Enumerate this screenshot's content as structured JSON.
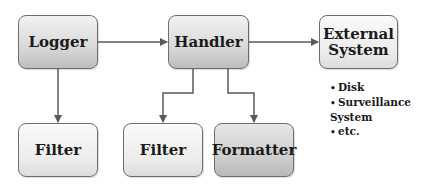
{
  "diagram": {
    "nodes": [
      {
        "id": "logger",
        "label": "Logger"
      },
      {
        "id": "handler",
        "label": "Handler"
      },
      {
        "id": "external",
        "label_line1": "External",
        "label_line2": "System"
      },
      {
        "id": "filter_logger",
        "label": "Filter"
      },
      {
        "id": "filter_handler",
        "label": "Filter"
      },
      {
        "id": "formatter",
        "label": "Formatter"
      }
    ],
    "edges": [
      {
        "from": "logger",
        "to": "handler"
      },
      {
        "from": "handler",
        "to": "external"
      },
      {
        "from": "logger",
        "to": "filter_logger"
      },
      {
        "from": "handler",
        "to": "filter_handler"
      },
      {
        "from": "handler",
        "to": "formatter"
      }
    ],
    "external_examples": [
      "Disk",
      "Surveillance System",
      "etc."
    ],
    "colors": {
      "border": "#6e6e6e",
      "line": "#5a5a5a",
      "text": "#1a1a1a"
    }
  }
}
